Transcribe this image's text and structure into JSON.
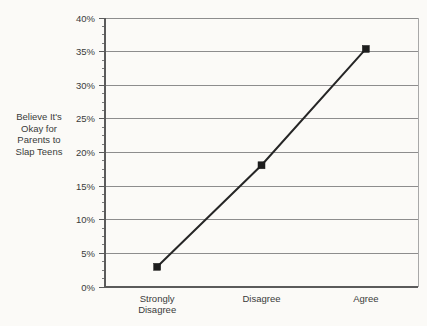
{
  "chart_data": {
    "type": "line",
    "title": "",
    "subtitle": "",
    "categories": [
      "Strongly Disagree",
      "Disagree",
      "Agree"
    ],
    "category_lines": [
      [
        "Strongly",
        "Disagree"
      ],
      [
        "Disagree"
      ],
      [
        "Agree"
      ]
    ],
    "values": [
      3.0,
      18.1,
      35.4
    ],
    "series": [
      {
        "name": "Believe It's Okay for Parents to Slap Teens",
        "values": [
          3.0,
          18.1,
          35.4
        ]
      }
    ],
    "xlabel": "",
    "ylabel": "Believe It's Okay for Parents to Slap Teens",
    "ylabel_lines": [
      "Believe It's",
      "Okay for",
      "Parents to",
      "Slap Teens"
    ],
    "ylim": [
      0,
      40
    ],
    "ytick_values": [
      0,
      5,
      10,
      15,
      20,
      25,
      30,
      35,
      40
    ],
    "ytick_labels": [
      "0%",
      "5%",
      "10%",
      "15%",
      "20%",
      "25%",
      "30%",
      "35%",
      "40%"
    ],
    "yminor_interval": 1.25,
    "grid": true,
    "grid_axis": "y",
    "legend": false,
    "legend_position": "none",
    "marker_shape": "square",
    "line_color": "#262626",
    "marker_color": "#1d1d1d",
    "grid_color": "#8d8d8d",
    "axis_color": "#5b5b5b",
    "background_color": "#fbfaf7",
    "annotations": []
  }
}
